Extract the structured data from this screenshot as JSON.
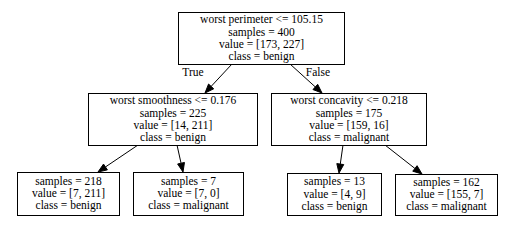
{
  "tree": {
    "nodes": [
      {
        "id": "root",
        "lines": [
          "worst perimeter <= 105.15",
          "samples = 400",
          "value = [173, 227]",
          "class = benign"
        ]
      },
      {
        "id": "left",
        "lines": [
          "worst smoothness <= 0.176",
          "samples = 225",
          "value = [14, 211]",
          "class = benign"
        ]
      },
      {
        "id": "right",
        "lines": [
          "worst concavity <= 0.218",
          "samples = 175",
          "value = [159, 16]",
          "class = malignant"
        ]
      },
      {
        "id": "left-left",
        "lines": [
          "samples = 218",
          "value = [7, 211]",
          "class = benign"
        ]
      },
      {
        "id": "left-right",
        "lines": [
          "samples = 7",
          "value = [7, 0]",
          "class = malignant"
        ]
      },
      {
        "id": "right-left",
        "lines": [
          "samples = 13",
          "value = [4, 9]",
          "class = benign"
        ]
      },
      {
        "id": "right-right",
        "lines": [
          "samples = 162",
          "value = [155, 7]",
          "class = malignant"
        ]
      }
    ],
    "edges": [
      {
        "from": "root",
        "to": "left",
        "label": "True"
      },
      {
        "from": "root",
        "to": "right",
        "label": "False"
      },
      {
        "from": "left",
        "to": "left-left",
        "label": ""
      },
      {
        "from": "left",
        "to": "left-right",
        "label": ""
      },
      {
        "from": "right",
        "to": "right-left",
        "label": ""
      },
      {
        "from": "right",
        "to": "right-right",
        "label": ""
      }
    ]
  }
}
